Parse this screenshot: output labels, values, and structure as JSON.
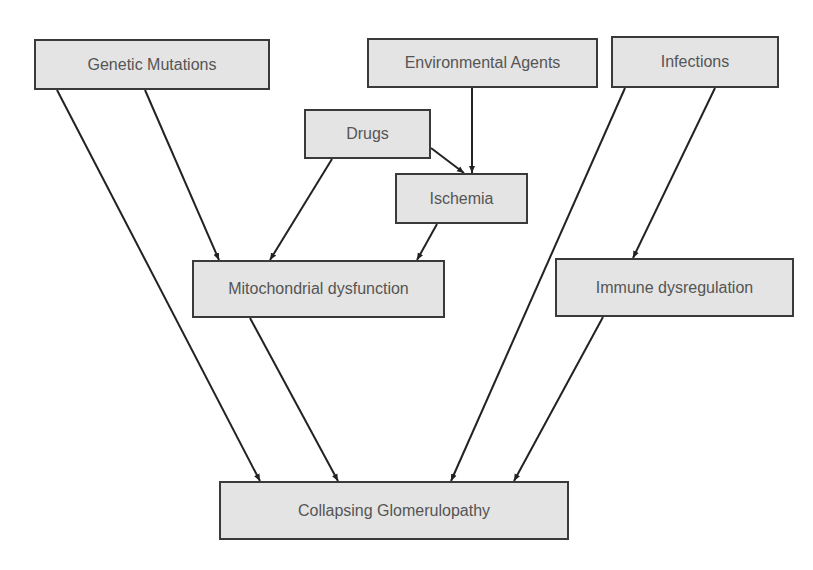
{
  "diagram": {
    "type": "flowchart",
    "nodes": [
      {
        "id": "genetic",
        "label": "Genetic Mutations",
        "x": 34,
        "y": 39,
        "w": 236,
        "h": 51
      },
      {
        "id": "environmental",
        "label": "Environmental Agents",
        "x": 367,
        "y": 38,
        "w": 231,
        "h": 50
      },
      {
        "id": "infections",
        "label": "Infections",
        "x": 611,
        "y": 36,
        "w": 168,
        "h": 52
      },
      {
        "id": "drugs",
        "label": "Drugs",
        "x": 304,
        "y": 109,
        "w": 127,
        "h": 50
      },
      {
        "id": "ischemia",
        "label": "Ischemia",
        "x": 395,
        "y": 173,
        "w": 133,
        "h": 51
      },
      {
        "id": "mito",
        "label": "Mitochondrial dysfunction",
        "x": 192,
        "y": 260,
        "w": 253,
        "h": 58
      },
      {
        "id": "immune",
        "label": "Immune dysregulation",
        "x": 555,
        "y": 258,
        "w": 239,
        "h": 59
      },
      {
        "id": "collapsing",
        "label": "Collapsing Glomerulopathy",
        "x": 219,
        "y": 481,
        "w": 350,
        "h": 59
      }
    ],
    "edges": [
      {
        "from": "genetic",
        "to": "collapsing",
        "x1": 57,
        "y1": 90,
        "x2": 260,
        "y2": 481
      },
      {
        "from": "genetic",
        "to": "mito",
        "x1": 145,
        "y1": 90,
        "x2": 219,
        "y2": 260
      },
      {
        "from": "drugs",
        "to": "mito",
        "x1": 332,
        "y1": 159,
        "x2": 270,
        "y2": 260
      },
      {
        "from": "drugs",
        "to": "ischemia",
        "x1": 431,
        "y1": 148,
        "x2": 464,
        "y2": 173
      },
      {
        "from": "environmental",
        "to": "ischemia",
        "x1": 472,
        "y1": 88,
        "x2": 472,
        "y2": 173
      },
      {
        "from": "ischemia",
        "to": "mito",
        "x1": 437,
        "y1": 224,
        "x2": 417,
        "y2": 260
      },
      {
        "from": "mito",
        "to": "collapsing",
        "x1": 250,
        "y1": 318,
        "x2": 338,
        "y2": 481
      },
      {
        "from": "infections",
        "to": "collapsing",
        "x1": 625,
        "y1": 88,
        "x2": 451,
        "y2": 481
      },
      {
        "from": "infections",
        "to": "immune",
        "x1": 715,
        "y1": 88,
        "x2": 633,
        "y2": 258
      },
      {
        "from": "immune",
        "to": "collapsing",
        "x1": 603,
        "y1": 317,
        "x2": 514,
        "y2": 481
      }
    ],
    "colors": {
      "node_fill": "#e4e4e4",
      "node_border": "#3a3a3a",
      "edge": "#222222",
      "text": "#555555"
    }
  }
}
